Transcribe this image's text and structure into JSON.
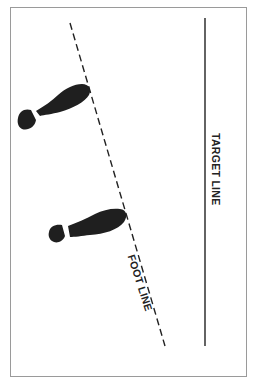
{
  "diagram": {
    "labels": {
      "target_line": "TARGET LINE",
      "foot_line": "FOOT LINE"
    },
    "elements": [
      {
        "type": "solid-line",
        "name": "target line",
        "orientation": "vertical"
      },
      {
        "type": "dashed-line",
        "name": "foot line",
        "orientation": "diagonal"
      },
      {
        "type": "shoe-print",
        "name": "upper foot",
        "toe_touching": "foot line"
      },
      {
        "type": "shoe-print",
        "name": "lower foot",
        "toe_touching": "foot line"
      }
    ],
    "colors": {
      "line": "#222222",
      "shoe": "#1f1f1f",
      "frame": "#9a9a9a"
    }
  }
}
